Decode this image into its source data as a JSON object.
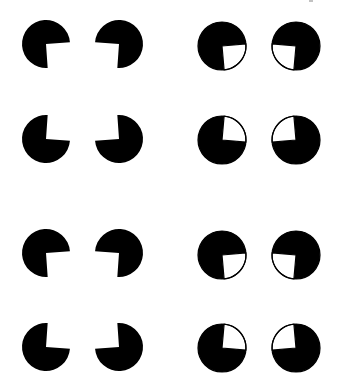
{
  "figure": {
    "colors": {
      "fill": "#000000",
      "background": "#ffffff",
      "wedge": "#ffffff",
      "outline": "#000000"
    },
    "panels": [
      {
        "name": "left-upper",
        "type": "pacman",
        "shapes": [
          {
            "cx": 46,
            "cy": 44,
            "r": 24,
            "notch": "bottom-right",
            "rot": -4
          },
          {
            "cx": 119,
            "cy": 44,
            "r": 24,
            "notch": "bottom-left",
            "rot": 4
          },
          {
            "cx": 46,
            "cy": 139,
            "r": 24,
            "notch": "top-right",
            "rot": 4
          },
          {
            "cx": 119,
            "cy": 139,
            "r": 24,
            "notch": "top-left",
            "rot": -4
          }
        ]
      },
      {
        "name": "right-upper",
        "type": "outlined-wedge",
        "shapes": [
          {
            "cx": 222,
            "cy": 46,
            "r": 24,
            "notch": "bottom-right",
            "rot": -5
          },
          {
            "cx": 296,
            "cy": 46,
            "r": 24,
            "notch": "bottom-left",
            "rot": 5
          },
          {
            "cx": 222,
            "cy": 140,
            "r": 24,
            "notch": "top-right",
            "rot": 5
          },
          {
            "cx": 296,
            "cy": 140,
            "r": 24,
            "notch": "top-left",
            "rot": -5
          }
        ]
      },
      {
        "name": "left-lower",
        "type": "pacman",
        "shapes": [
          {
            "cx": 46,
            "cy": 253,
            "r": 24,
            "notch": "bottom-right",
            "rot": -4
          },
          {
            "cx": 119,
            "cy": 253,
            "r": 24,
            "notch": "bottom-left",
            "rot": 4
          },
          {
            "cx": 46,
            "cy": 347,
            "r": 24,
            "notch": "top-right",
            "rot": 4
          },
          {
            "cx": 119,
            "cy": 347,
            "r": 24,
            "notch": "top-left",
            "rot": -4
          }
        ]
      },
      {
        "name": "right-lower",
        "type": "outlined-wedge",
        "shapes": [
          {
            "cx": 222,
            "cy": 255,
            "r": 24,
            "notch": "bottom-right",
            "rot": -5
          },
          {
            "cx": 296,
            "cy": 255,
            "r": 24,
            "notch": "bottom-left",
            "rot": 5
          },
          {
            "cx": 222,
            "cy": 348,
            "r": 24,
            "notch": "top-right",
            "rot": 5
          },
          {
            "cx": 296,
            "cy": 348,
            "r": 24,
            "notch": "top-left",
            "rot": -5
          }
        ]
      }
    ]
  }
}
